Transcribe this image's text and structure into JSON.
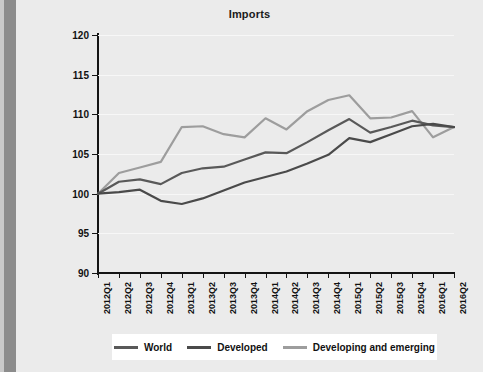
{
  "chart_data": {
    "type": "line",
    "title": "Imports",
    "xlabel": "",
    "ylabel": "",
    "ylim": [
      90,
      120
    ],
    "yticks": [
      90,
      95,
      100,
      105,
      110,
      115,
      120
    ],
    "grid": true,
    "legend_position": "bottom",
    "categories": [
      "2012Q1",
      "2012Q2",
      "2012Q3",
      "2012Q4",
      "2013Q1",
      "2013Q2",
      "2013Q3",
      "2013Q4",
      "2014Q1",
      "2014Q2",
      "2014Q3",
      "2014Q4",
      "2015Q1",
      "2015Q2",
      "2015Q3",
      "2015Q4",
      "2016Q1",
      "2016Q2"
    ],
    "series": [
      {
        "name": "World",
        "color": "#595959",
        "values": [
          100.0,
          101.5,
          101.8,
          101.2,
          102.6,
          103.2,
          103.4,
          104.3,
          105.2,
          105.1,
          106.5,
          108.0,
          109.4,
          107.7,
          108.4,
          109.2,
          108.6,
          108.4
        ]
      },
      {
        "name": "Developed",
        "color": "#4a4a4a",
        "values": [
          100.0,
          100.2,
          100.5,
          99.1,
          98.7,
          99.4,
          100.4,
          101.4,
          102.1,
          102.8,
          103.8,
          104.9,
          107.0,
          106.5,
          107.5,
          108.5,
          108.8,
          108.4
        ]
      },
      {
        "name": "Developing and emerging",
        "color": "#9d9d9d",
        "values": [
          100.0,
          102.6,
          103.3,
          104.0,
          108.4,
          108.5,
          107.5,
          107.1,
          109.5,
          108.1,
          110.4,
          111.8,
          112.4,
          109.5,
          109.6,
          110.4,
          107.1,
          108.4
        ]
      }
    ]
  },
  "legend": {
    "items": [
      {
        "label": "World"
      },
      {
        "label": "Developed"
      },
      {
        "label": "Developing and emerging"
      }
    ]
  }
}
